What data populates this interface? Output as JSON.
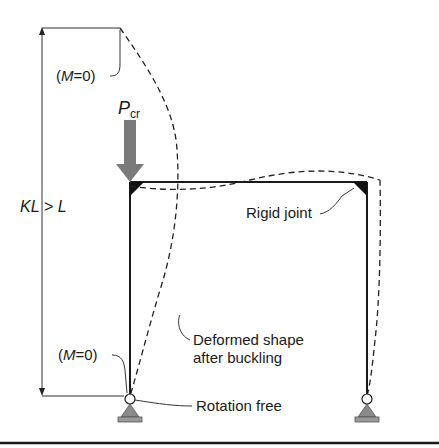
{
  "labels": {
    "top_moment": [
      "(",
      "M",
      "=0)"
    ],
    "load": {
      "symbol": "P",
      "subscript": "cr"
    },
    "effective_length": [
      "KL",
      " > ",
      "L"
    ],
    "rigid_joint": "Rigid joint",
    "deformed_shape_line1": "Deformed shape",
    "deformed_shape_line2": "after buckling",
    "bottom_moment": [
      "(",
      "M",
      "=0)"
    ],
    "rotation_free": "Rotation free"
  },
  "colors": {
    "line": "#1a1a1a",
    "arrow": "#7a7a7a",
    "support": "#8a8a8a"
  }
}
